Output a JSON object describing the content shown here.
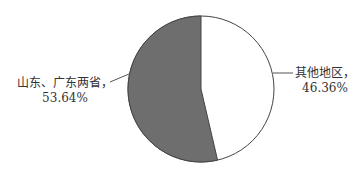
{
  "chart_data": {
    "type": "pie",
    "title": "",
    "categories": [
      "山东、广东两省",
      "其他地区"
    ],
    "values": [
      53.64,
      46.36
    ],
    "unit": "%",
    "colors": [
      "#6e6e6e",
      "#ffffff"
    ],
    "labels": [
      {
        "name": "山东、广东两省，",
        "value": "53.64%"
      },
      {
        "name": "其他地区，",
        "value": "46.36%"
      }
    ],
    "legend": "none"
  }
}
